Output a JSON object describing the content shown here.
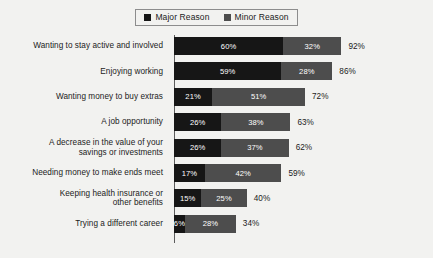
{
  "legend": {
    "entries": [
      {
        "label": "Major Reason",
        "color": "#161616",
        "swatch": "major-reason-swatch"
      },
      {
        "label": "Minor Reason",
        "color": "#4d4d4d",
        "swatch": "minor-reason-swatch"
      }
    ]
  },
  "chart_data": {
    "type": "bar",
    "title": "",
    "subtitle": "",
    "xlabel": "",
    "ylabel": "",
    "orientation": "horizontal",
    "stacked": true,
    "grid": false,
    "legend_position": "top-center",
    "xlim": [
      0,
      100
    ],
    "categories": [
      "Wanting to stay active and involved",
      "Enjoying working",
      "Wanting money to buy extras",
      "A job opportunity",
      "A decrease in the value of your savings or investments",
      "Needing money to make ends meet",
      "Keeping health insurance or other benefits",
      "Trying a different career"
    ],
    "series": [
      {
        "name": "Major Reason",
        "color": "#161616",
        "values": [
          60,
          59,
          21,
          26,
          26,
          17,
          15,
          6
        ]
      },
      {
        "name": "Minor Reason",
        "color": "#4d4d4d",
        "values": [
          32,
          28,
          51,
          38,
          37,
          42,
          25,
          28
        ]
      }
    ],
    "totals": [
      92,
      86,
      72,
      63,
      62,
      59,
      40,
      34
    ],
    "rows": [
      {
        "label_lines": [
          "Wanting to stay active and involved"
        ],
        "major": "60%",
        "minor": "32%",
        "total": "92%",
        "major_value": 60,
        "minor_value": 32,
        "total_value": 92
      },
      {
        "label_lines": [
          "Enjoying working"
        ],
        "major": "59%",
        "minor": "28%",
        "total": "86%",
        "major_value": 59,
        "minor_value": 28,
        "total_value": 86
      },
      {
        "label_lines": [
          "Wanting money to buy extras"
        ],
        "major": "21%",
        "minor": "51%",
        "total": "72%",
        "major_value": 21,
        "minor_value": 51,
        "total_value": 72
      },
      {
        "label_lines": [
          "A job opportunity"
        ],
        "major": "26%",
        "minor": "38%",
        "total": "63%",
        "major_value": 26,
        "minor_value": 38,
        "total_value": 63
      },
      {
        "label_lines": [
          "A decrease in the value of your",
          "savings or investments"
        ],
        "major": "26%",
        "minor": "37%",
        "total": "62%",
        "major_value": 26,
        "minor_value": 37,
        "total_value": 62
      },
      {
        "label_lines": [
          "Needing money to make ends meet"
        ],
        "major": "17%",
        "minor": "42%",
        "total": "59%",
        "major_value": 17,
        "minor_value": 42,
        "total_value": 59
      },
      {
        "label_lines": [
          "Keeping health insurance or",
          "other benefits"
        ],
        "major": "15%",
        "minor": "25%",
        "total": "40%",
        "major_value": 15,
        "minor_value": 25,
        "total_value": 40
      },
      {
        "label_lines": [
          "Trying a different career"
        ],
        "major": "6%",
        "minor": "28%",
        "total": "34%",
        "major_value": 6,
        "minor_value": 28,
        "total_value": 34
      }
    ]
  },
  "colors": {
    "background": "#f2f2f0",
    "major": "#161616",
    "minor": "#4d4d4d",
    "axis": "#5c5c5c",
    "text": "#1b1b1b",
    "value_text": "#ffffff"
  }
}
